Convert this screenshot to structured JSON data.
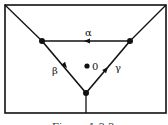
{
  "diagram": {
    "labels": {
      "top_edge": "α",
      "left_edge": "β",
      "right_edge": "γ",
      "center": "0"
    },
    "caption": "Figure 1.3.3",
    "colors": {
      "line": "#111111",
      "background": "#ffffff"
    }
  }
}
